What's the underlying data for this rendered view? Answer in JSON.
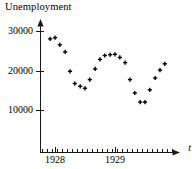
{
  "chart_data": {
    "type": "scatter",
    "title": "Unemployment",
    "xlabel": "t",
    "ylabel": "",
    "grid": false,
    "legend": null,
    "marker": "plus",
    "marker_color": "#000000",
    "axis_color": "#1a1a1a",
    "xlim": [
      1927.75,
      1930.0
    ],
    "ylim": [
      0,
      31500
    ],
    "yticks": [
      10000,
      20000,
      30000
    ],
    "ytick_labels": [
      "10000",
      "20000",
      "30000"
    ],
    "xticks": [
      1928,
      1929
    ],
    "xtick_labels": [
      "1928",
      "1929"
    ],
    "x_minor_tick_count": 27,
    "x": [
      1927.92,
      1928.0,
      1928.08,
      1928.17,
      1928.25,
      1928.33,
      1928.42,
      1928.5,
      1928.58,
      1928.67,
      1928.75,
      1928.83,
      1928.92,
      1929.0,
      1929.08,
      1929.17,
      1929.25,
      1929.33,
      1929.42,
      1929.5,
      1929.58,
      1929.67,
      1929.75,
      1929.83
    ],
    "values": [
      28000,
      28300,
      26500,
      24700,
      19800,
      16700,
      16000,
      15500,
      17700,
      20400,
      22800,
      23800,
      24000,
      24100,
      23300,
      22000,
      17700,
      14300,
      12000,
      12000,
      15100,
      18100,
      20100,
      21700
    ],
    "point_labels": [
      "1927.92",
      "1928.00",
      "1928.08",
      "1928.17",
      "1928.25",
      "1928.33",
      "1928.42",
      "1928.50",
      "1928.58",
      "1928.67",
      "1928.75",
      "1928.83",
      "1928.92",
      "1929.00",
      "1929.08",
      "1929.17",
      "1929.25",
      "1929.33",
      "1929.42",
      "1929.50",
      "1929.58",
      "1929.67",
      "1929.75",
      "1929.83"
    ]
  },
  "geometry": {
    "origin_x": 40,
    "baseline_y": 152,
    "x_right": 176,
    "y_top": 22,
    "px_per_year": 60,
    "y_10000_px": 110,
    "y_20000_px": 70.5,
    "y_30000_px": 31
  }
}
